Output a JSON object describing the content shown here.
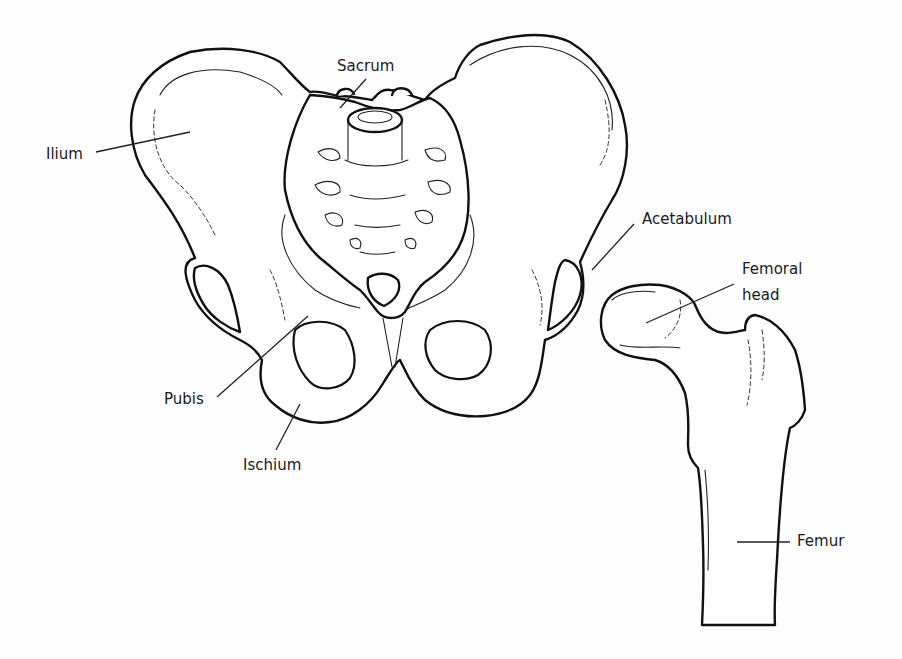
{
  "diagram": {
    "colors": {
      "line": "#111111",
      "background": "#ffffff",
      "text": "#1a1a1a"
    },
    "labels": {
      "ilium": "Ilium",
      "sacrum": "Sacrum",
      "acetabulum": "Acetabulum",
      "femoral_head_line1": "Femoral",
      "femoral_head_line2": "head",
      "pubis": "Pubis",
      "ischium": "Ischium",
      "femur": "Femur"
    }
  }
}
